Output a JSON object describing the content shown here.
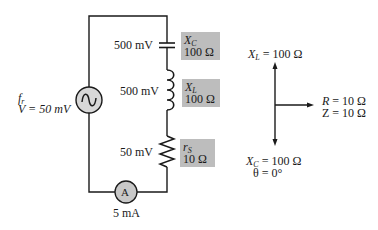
{
  "diagram": {
    "type": "series RLC circuit at resonance with phasor diagram",
    "colors": {
      "wire": "#1a1a1a",
      "label_box": "#bdbdbd",
      "meter_fill": "#c8c8c8",
      "background": "#ffffff"
    },
    "source": {
      "symbol": "ac-source",
      "freq_label": "f",
      "freq_sub": "r",
      "voltage_label": "V = 50 mV"
    },
    "components": [
      {
        "id": "capacitor",
        "voltage": "500 mV",
        "name": "X",
        "name_sub": "C",
        "value": "100 Ω"
      },
      {
        "id": "inductor",
        "voltage": "500 mV",
        "name": "X",
        "name_sub": "L",
        "value": "100 Ω"
      },
      {
        "id": "resistor",
        "voltage": "50 mV",
        "name": "r",
        "name_sub": "S",
        "value": "10 Ω"
      }
    ],
    "ammeter": {
      "symbol": "A",
      "reading": "5 mA"
    },
    "phasor": {
      "up": {
        "name": "X",
        "sub": "L",
        "text": " = 100 Ω"
      },
      "right": {
        "line1_name": "R",
        "line1_text": " = 10 Ω",
        "line2": "Z = 10 Ω"
      },
      "down": {
        "name": "X",
        "sub": "C",
        "text": " = 100 Ω",
        "angle": "θ = 0°"
      }
    }
  }
}
